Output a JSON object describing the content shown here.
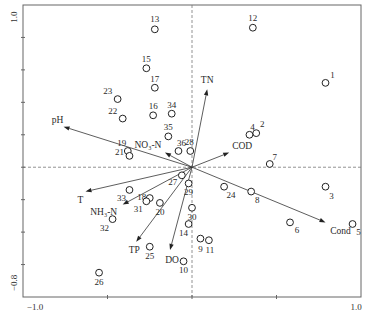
{
  "chart_data": {
    "type": "scatter",
    "subtype": "ordination-biplot",
    "title": "",
    "xlabel": "",
    "ylabel": "",
    "xlim": [
      -1.0,
      1.0
    ],
    "ylim": [
      -0.8,
      1.0
    ],
    "x_tick_labels": [
      {
        "value": -1.0,
        "text": "−1.0"
      },
      {
        "value": 1.0,
        "text": "1.0"
      }
    ],
    "y_tick_labels": [
      {
        "value": 1.0,
        "text": "1.0"
      },
      {
        "value": -0.8,
        "text": "−0.8"
      }
    ],
    "x_ticks": [
      -0.5,
      0,
      0.5
    ],
    "y_ticks": [
      0.8,
      0.6,
      0.4,
      0.2,
      0,
      -0.2,
      -0.4,
      -0.6
    ],
    "zero_lines": "dashed",
    "grid": false,
    "legend": null,
    "sites": [
      {
        "id": "1",
        "x": 0.79,
        "y": 0.52,
        "lp": [
          7,
          -8
        ]
      },
      {
        "id": "2",
        "x": 0.38,
        "y": 0.21,
        "lp": [
          6,
          -9
        ]
      },
      {
        "id": "3",
        "x": 0.79,
        "y": -0.12,
        "lp": [
          6,
          9
        ]
      },
      {
        "id": "4",
        "x": 0.34,
        "y": 0.2,
        "lp": [
          3,
          -8
        ]
      },
      {
        "id": "5",
        "x": 0.95,
        "y": -0.35,
        "lp": [
          6,
          8
        ]
      },
      {
        "id": "6",
        "x": 0.58,
        "y": -0.34,
        "lp": [
          7,
          8
        ]
      },
      {
        "id": "7",
        "x": 0.46,
        "y": 0.02,
        "lp": [
          5,
          -7
        ]
      },
      {
        "id": "8",
        "x": 0.35,
        "y": -0.15,
        "lp": [
          6,
          8
        ]
      },
      {
        "id": "9",
        "x": 0.05,
        "y": -0.44,
        "lp": [
          0,
          10
        ]
      },
      {
        "id": "10",
        "x": -0.05,
        "y": -0.58,
        "lp": [
          0,
          9
        ]
      },
      {
        "id": "11",
        "x": 0.1,
        "y": -0.45,
        "lp": [
          1,
          10
        ]
      },
      {
        "id": "12",
        "x": 0.36,
        "y": 0.86,
        "lp": [
          0,
          -10
        ]
      },
      {
        "id": "13",
        "x": -0.22,
        "y": 0.85,
        "lp": [
          0,
          -10
        ]
      },
      {
        "id": "14",
        "x": -0.02,
        "y": -0.35,
        "lp": [
          -5,
          9
        ]
      },
      {
        "id": "15",
        "x": -0.27,
        "y": 0.61,
        "lp": [
          0,
          -9
        ]
      },
      {
        "id": "16",
        "x": -0.23,
        "y": 0.32,
        "lp": [
          0,
          -9
        ]
      },
      {
        "id": "17",
        "x": -0.22,
        "y": 0.49,
        "lp": [
          0,
          -9
        ]
      },
      {
        "id": "18",
        "x": -0.25,
        "y": -0.19,
        "lp": [
          -8,
          -1
        ]
      },
      {
        "id": "19",
        "x": -0.38,
        "y": 0.1,
        "lp": [
          -6,
          -8
        ]
      },
      {
        "id": "20",
        "x": -0.19,
        "y": -0.22,
        "lp": [
          0,
          9
        ]
      },
      {
        "id": "21",
        "x": -0.37,
        "y": 0.07,
        "lp": [
          -10,
          -4
        ]
      },
      {
        "id": "22",
        "x": -0.41,
        "y": 0.3,
        "lp": [
          -10,
          -8
        ]
      },
      {
        "id": "23",
        "x": -0.44,
        "y": 0.42,
        "lp": [
          -10,
          -8
        ]
      },
      {
        "id": "24",
        "x": 0.19,
        "y": -0.12,
        "lp": [
          7,
          8
        ]
      },
      {
        "id": "25",
        "x": -0.25,
        "y": -0.49,
        "lp": [
          0,
          9
        ]
      },
      {
        "id": "26",
        "x": -0.55,
        "y": -0.65,
        "lp": [
          0,
          9
        ]
      },
      {
        "id": "27",
        "x": -0.06,
        "y": -0.05,
        "lp": [
          -9,
          7
        ]
      },
      {
        "id": "28",
        "x": -0.01,
        "y": 0.1,
        "lp": [
          -1,
          -9
        ]
      },
      {
        "id": "29",
        "x": -0.02,
        "y": -0.1,
        "lp": [
          0,
          9
        ]
      },
      {
        "id": "30",
        "x": 0.0,
        "y": -0.25,
        "lp": [
          0,
          9
        ]
      },
      {
        "id": "31",
        "x": -0.27,
        "y": -0.21,
        "lp": [
          -8,
          8
        ]
      },
      {
        "id": "32",
        "x": -0.47,
        "y": -0.32,
        "lp": [
          -8,
          9
        ]
      },
      {
        "id": "33",
        "x": -0.37,
        "y": -0.14,
        "lp": [
          -8,
          8
        ]
      },
      {
        "id": "34",
        "x": -0.12,
        "y": 0.33,
        "lp": [
          0,
          -9
        ]
      },
      {
        "id": "35",
        "x": -0.14,
        "y": 0.19,
        "lp": [
          0,
          -9
        ]
      },
      {
        "id": "36",
        "x": -0.08,
        "y": 0.1,
        "lp": [
          3,
          -8
        ]
      }
    ],
    "variables": [
      {
        "name": "TN",
        "x": 0.09,
        "y": 0.48,
        "lp": [
          0,
          -9
        ]
      },
      {
        "name": "COD",
        "x": 0.22,
        "y": 0.09,
        "lp": [
          13,
          -7
        ]
      },
      {
        "name": "Cond",
        "x": 0.79,
        "y": -0.34,
        "lp": [
          15,
          9
        ]
      },
      {
        "name": "pH",
        "x": -0.76,
        "y": 0.25,
        "lp": [
          -6,
          -7
        ]
      },
      {
        "name": "NO₃-N",
        "x": -0.16,
        "y": 0.09,
        "lp": [
          -17,
          -8
        ]
      },
      {
        "name": "T",
        "x": -0.63,
        "y": -0.15,
        "lp": [
          -5,
          8
        ]
      },
      {
        "name": "NH₃-N",
        "x": -0.41,
        "y": -0.23,
        "lp": [
          -19,
          7
        ]
      },
      {
        "name": "TP",
        "x": -0.33,
        "y": -0.46,
        "lp": [
          -2,
          8
        ]
      },
      {
        "name": "DO",
        "x": -0.13,
        "y": -0.51,
        "lp": [
          2,
          10
        ]
      }
    ]
  }
}
